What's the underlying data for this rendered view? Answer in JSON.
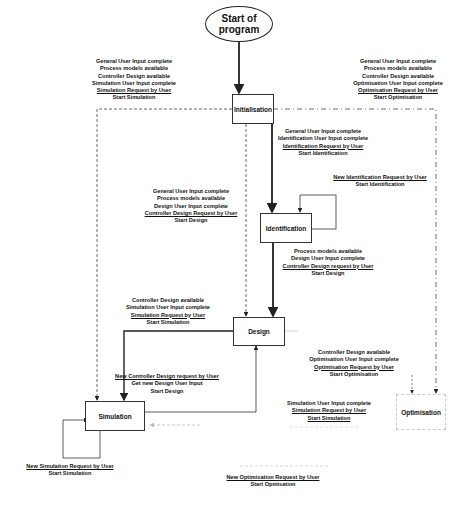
{
  "start": {
    "line1": "Start of",
    "line2": "program"
  },
  "nodes": {
    "initialisation": "Initialisation",
    "identification": "Identification",
    "design": "Design",
    "simulation": "Simulation",
    "optimisation": "Optimisation"
  },
  "labels": {
    "init_to_sim": [
      "General User Input complete",
      "Process models available",
      "Controller Design available",
      "Simulation User Input complete",
      "Simulation Request by User",
      "Start Simulation"
    ],
    "init_to_opt": [
      "General User Input complete",
      "Process models available",
      "Controller Design available",
      "Optimisation User Input complete",
      "Optimisation Request by User",
      "Start Optimisation"
    ],
    "init_to_ident": [
      "General User Input complete",
      "Identification User Input complete",
      "Identification Request by User",
      "Start Identification"
    ],
    "ident_loop": [
      "New Identification Request by User",
      "Start Identification"
    ],
    "init_to_design": [
      "General User Input complete",
      "Process models available",
      "Design User Input complete",
      "Controller Design Request by User",
      "Start Design"
    ],
    "ident_to_design": [
      "Process models available",
      "Design User Input complete",
      "Controller Design request by User",
      "Start Design"
    ],
    "design_to_sim": [
      "Controller Design available",
      "Simulation User Input complete",
      "Simulation Request by User",
      "Start Simulation"
    ],
    "design_to_opt": [
      "Controller Design available",
      "Optimisation User Input complete",
      "Optimisation Request by User",
      "Start Optimisation"
    ],
    "sim_to_design": [
      "New Controller Design request by User",
      "Get new Design User Input",
      "Start Design"
    ],
    "opt_to_sim": [
      "Simulation User Input complete",
      "Simulation Request by User",
      "Start Simulation"
    ],
    "sim_loop": [
      "New Simulation Request by User",
      "Start Simulation"
    ],
    "opt_loop": [
      "New Optimisation Request by User",
      "Start Opmisation"
    ]
  },
  "colors": {
    "line": "#222222",
    "faint": "#c8c8c8",
    "background": "#ffffff"
  }
}
